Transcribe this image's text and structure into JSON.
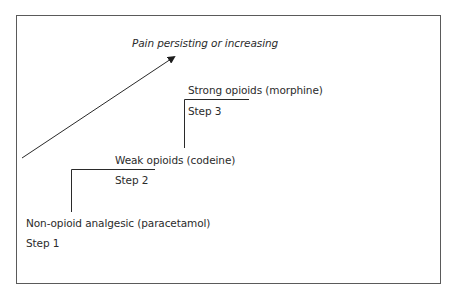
{
  "diagram": {
    "arrow_label": "Pain persisting or increasing",
    "steps": [
      {
        "step_label": "Step 1",
        "drug_label": "Non-opioid analgesic (paracetamol)"
      },
      {
        "step_label": "Step 2",
        "drug_label": "Weak opioids (codeine)"
      },
      {
        "step_label": "Step 3",
        "drug_label": "Strong opioids (morphine)"
      }
    ],
    "colors": {
      "line": "#2a2a2a",
      "frame": "#5a5a5a",
      "text": "#2b2b2b",
      "background": "#ffffff"
    }
  }
}
